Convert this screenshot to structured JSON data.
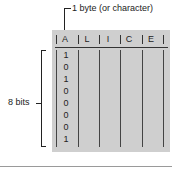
{
  "diagram": {
    "callout_label": "1 byte (or character)",
    "brace_label": "8 bits",
    "header_chars": [
      "A",
      "L",
      "I",
      "C",
      "E"
    ],
    "bits": [
      "1",
      "0",
      "1",
      "0",
      "0",
      "0",
      "0",
      "1"
    ],
    "colors": {
      "panel": "#cfcfcf",
      "ink": "#222222",
      "bottom_rule": "#9a9a9a"
    }
  }
}
